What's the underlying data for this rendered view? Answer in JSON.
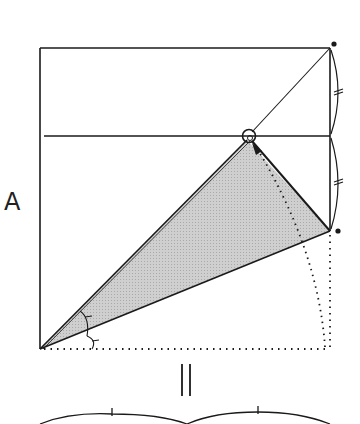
{
  "diagram": {
    "type": "origami-fold-diagram",
    "step_label": "A",
    "equals_symbol": "||",
    "colors": {
      "line": "#1a1a1a",
      "shade": "#c8c8c8",
      "background": "#ffffff"
    },
    "elements": {
      "square": {
        "x": 40,
        "y": 48,
        "w": 290,
        "h": 301
      },
      "midline_y": 136,
      "reference_point": {
        "x": 249,
        "y": 136,
        "marker": "circle"
      },
      "folded_flap_corner": {
        "x": 330,
        "y": 231
      },
      "shaded_flap": [
        [
          40,
          349
        ],
        [
          249,
          138
        ],
        [
          330,
          231
        ]
      ],
      "diagonal_crease": [
        [
          249,
          136
        ],
        [
          330,
          48
        ]
      ],
      "corner_dots": [
        [
          334,
          44
        ],
        [
          338,
          231
        ]
      ],
      "equal_length_marks": [
        "top-half-right-edge",
        "bottom-half-right-edge"
      ],
      "equal_angle_marks": 2,
      "fold_arrow": "dotted arc from bottom-right corner to reference point"
    }
  }
}
